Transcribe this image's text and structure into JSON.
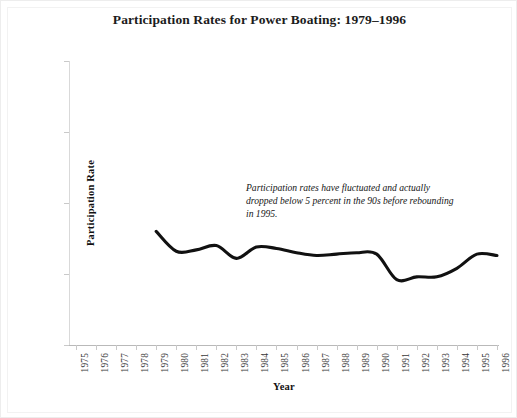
{
  "chart_data": {
    "type": "line",
    "title": "Participation Rates for Power Boating: 1979–1996",
    "xlabel": "Year",
    "ylabel": "Participation Rate",
    "grid": false,
    "legend": "none",
    "xlim": [
      1975,
      1996
    ],
    "ylim": [
      0.0,
      20.0
    ],
    "y_tick_labels": [
      "0.0%",
      "5.0%",
      "10.0%",
      "15.0%",
      "20.0%"
    ],
    "y_tick_values": [
      0.0,
      5.0,
      10.0,
      15.0,
      20.0
    ],
    "x_tick_labels": [
      "1975",
      "1976",
      "1977",
      "1978",
      "1979",
      "1980",
      "1981",
      "1982",
      "1983",
      "1984",
      "1985",
      "1986",
      "1987",
      "1988",
      "1989",
      "1990",
      "1991",
      "1992",
      "1993",
      "1994",
      "1995",
      "1996"
    ],
    "series": [
      {
        "name": "Power Boating",
        "color": "#111111",
        "x": [
          1979,
          1980,
          1981,
          1982,
          1983,
          1984,
          1985,
          1986,
          1987,
          1988,
          1989,
          1990,
          1991,
          1992,
          1993,
          1994,
          1995,
          1996
        ],
        "values": [
          8.0,
          6.6,
          6.7,
          7.0,
          6.1,
          6.9,
          6.8,
          6.5,
          6.3,
          6.4,
          6.5,
          6.4,
          4.6,
          4.8,
          4.8,
          5.4,
          6.4,
          6.3
        ]
      }
    ],
    "annotation": "Participation rates have fluctuated and actually dropped below 5 percent in the 90s before rebounding in 1995."
  }
}
